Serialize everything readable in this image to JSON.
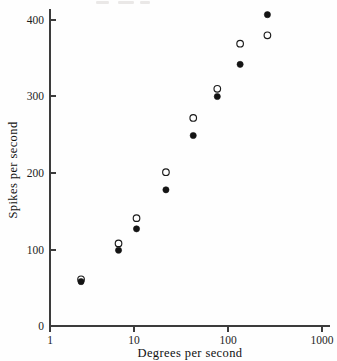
{
  "chart_data": {
    "type": "scatter",
    "title": "",
    "xlabel": "Degrees per second",
    "ylabel": "Spikes per second",
    "xscale": "log",
    "yscale": "linear",
    "xlim": [
      1,
      1000
    ],
    "ylim": [
      0,
      430
    ],
    "xticks": [
      1,
      10,
      100,
      1000
    ],
    "xtick_labels": [
      "1",
      "10",
      "100",
      "1000"
    ],
    "yticks": [
      0,
      100,
      200,
      300,
      400
    ],
    "ytick_labels": [
      "0",
      "100",
      "200",
      "300",
      "400"
    ],
    "grid": false,
    "legend": "none",
    "series": [
      {
        "name": "open-circles",
        "marker": "open circle",
        "color": "#1a1a1a",
        "points": [
          {
            "x": 2.2,
            "y": 61
          },
          {
            "x": 5.7,
            "y": 108
          },
          {
            "x": 9.0,
            "y": 141
          },
          {
            "x": 19.0,
            "y": 201
          },
          {
            "x": 38.0,
            "y": 272
          },
          {
            "x": 70.0,
            "y": 310
          },
          {
            "x": 125.0,
            "y": 369
          },
          {
            "x": 250.0,
            "y": 380
          }
        ]
      },
      {
        "name": "filled-circles",
        "marker": "filled circle",
        "color": "#141414",
        "points": [
          {
            "x": 2.2,
            "y": 58
          },
          {
            "x": 5.7,
            "y": 99
          },
          {
            "x": 9.0,
            "y": 127
          },
          {
            "x": 19.0,
            "y": 178
          },
          {
            "x": 38.0,
            "y": 249
          },
          {
            "x": 70.0,
            "y": 300
          },
          {
            "x": 125.0,
            "y": 342
          },
          {
            "x": 250.0,
            "y": 407
          }
        ]
      }
    ]
  },
  "axes": {
    "x_title": "Degrees per second",
    "y_title": "Spikes per second",
    "x_tick_labels": [
      "1",
      "10",
      "100",
      "1000"
    ],
    "y_tick_labels": [
      "0",
      "100",
      "200",
      "300",
      "400"
    ]
  },
  "colors": {
    "axis": "#3c3c3c",
    "text": "#1a1a1a",
    "marker_fill": "#141414",
    "marker_open_stroke": "#1a1a1a",
    "background": "#fefefe"
  }
}
